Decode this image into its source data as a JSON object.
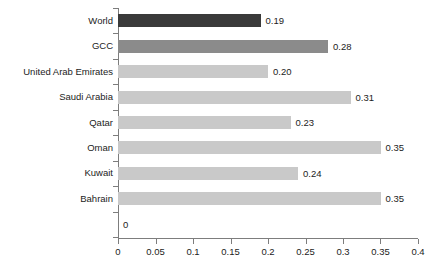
{
  "chart_data": {
    "type": "bar",
    "orientation": "horizontal",
    "title": "",
    "subtitle": "",
    "xlabel": "",
    "ylabel": "",
    "xlim": [
      0,
      0.4
    ],
    "xticks": [
      "0",
      "0.05",
      "0.1",
      "0.15",
      "0.2",
      "0.25",
      "0.3",
      "0.35",
      "0.4"
    ],
    "xtick_values": [
      0,
      0.05,
      0.1,
      0.15,
      0.2,
      0.25,
      0.3,
      0.35,
      0.4
    ],
    "grid": false,
    "legend": "none",
    "categories": [
      "World",
      "GCC",
      "United Arab Emirates",
      "Saudi Arabia",
      "Qatar",
      "Oman",
      "Kuwait",
      "Bahrain",
      ""
    ],
    "values": [
      0.19,
      0.28,
      0.2,
      0.31,
      0.23,
      0.35,
      0.24,
      0.35,
      0
    ],
    "data_labels": [
      "0.19",
      "0.28",
      "0.20",
      "0.31",
      "0.23",
      "0.35",
      "0.24",
      "0.35",
      "0"
    ],
    "bar_colors": [
      "#3a3a3a",
      "#8b8b8b",
      "#c9c9c9",
      "#c9c9c9",
      "#c9c9c9",
      "#c9c9c9",
      "#c9c9c9",
      "#c9c9c9",
      "#c9c9c9"
    ],
    "bars": [
      {
        "label": "World",
        "value": 0.19,
        "data_label": "0.19",
        "color": "#3a3a3a"
      },
      {
        "label": "GCC",
        "value": 0.28,
        "data_label": "0.28",
        "color": "#8b8b8b"
      },
      {
        "label": "United Arab Emirates",
        "value": 0.2,
        "data_label": "0.20",
        "color": "#c9c9c9"
      },
      {
        "label": "Saudi Arabia",
        "value": 0.31,
        "data_label": "0.31",
        "color": "#c9c9c9"
      },
      {
        "label": "Qatar",
        "value": 0.23,
        "data_label": "0.23",
        "color": "#c9c9c9"
      },
      {
        "label": "Oman",
        "value": 0.35,
        "data_label": "0.35",
        "color": "#c9c9c9"
      },
      {
        "label": "Kuwait",
        "value": 0.24,
        "data_label": "0.24",
        "color": "#c9c9c9"
      },
      {
        "label": "Bahrain",
        "value": 0.35,
        "data_label": "0.35",
        "color": "#c9c9c9"
      },
      {
        "label": "",
        "value": 0,
        "data_label": "0",
        "color": "#c9c9c9"
      }
    ],
    "axis_color": "#7d7d7d",
    "text_color": "#1c1c1c",
    "background": "#ffffff"
  }
}
